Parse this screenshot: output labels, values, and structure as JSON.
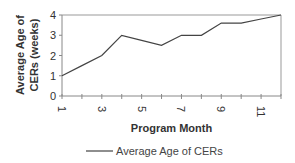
{
  "chart_data": {
    "type": "line",
    "title": "",
    "xlabel": "Program Month",
    "ylabel": "Average Age of CERs (weeks)",
    "ylabel_lines": [
      "Average Age of",
      "CERs (weeks)"
    ],
    "x": [
      1,
      2,
      3,
      4,
      5,
      6,
      7,
      8,
      9,
      10,
      11,
      12
    ],
    "x_tick_labels": [
      "1",
      "3",
      "5",
      "7",
      "9",
      "11"
    ],
    "y_tick_labels": [
      "0",
      "1",
      "2",
      "3",
      "4"
    ],
    "ylim": [
      0,
      4
    ],
    "xlim": [
      1,
      12
    ],
    "grid": false,
    "legend_position": "bottom",
    "series": [
      {
        "name": "Average Age of CERs",
        "color": "#444444",
        "values": [
          1.0,
          1.5,
          2.0,
          3.0,
          2.75,
          2.5,
          3.0,
          3.0,
          3.6,
          3.6,
          3.8,
          4.0
        ]
      }
    ]
  }
}
